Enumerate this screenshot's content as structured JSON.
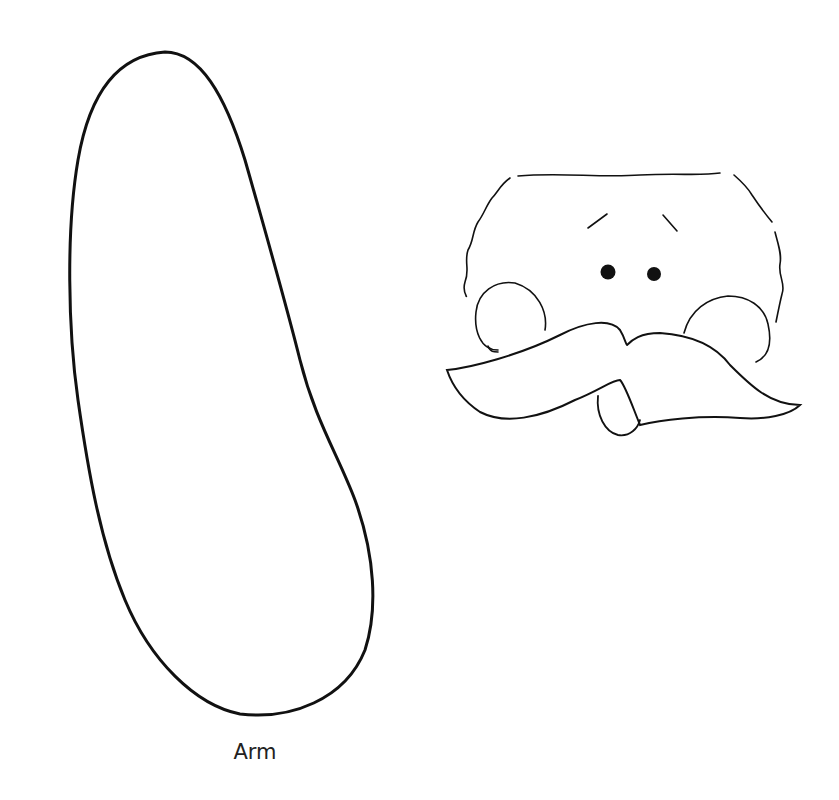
{
  "page": {
    "background": "#ffffff",
    "stroke_color": "#111111"
  },
  "pieces": [
    {
      "name": "arm",
      "label": "Arm"
    },
    {
      "name": "face",
      "label": ""
    }
  ],
  "labels": {
    "arm": "Arm"
  }
}
